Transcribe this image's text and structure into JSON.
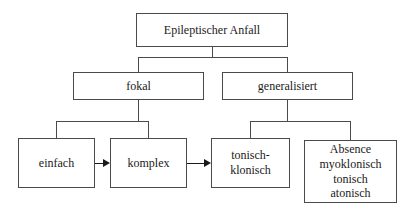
{
  "diagram": {
    "title_text": "Epileptischer Anfall",
    "nodes": [
      {
        "id": "root",
        "label": "Epileptischer Anfall",
        "x": 136,
        "y": 13,
        "w": 152,
        "h": 34
      },
      {
        "id": "fokal",
        "label": "fokal",
        "x": 73,
        "y": 72,
        "w": 131,
        "h": 28
      },
      {
        "id": "generalisiert",
        "label": "generalisiert",
        "x": 222,
        "y": 72,
        "w": 131,
        "h": 28
      },
      {
        "id": "einfach",
        "label": "einfach",
        "x": 18,
        "y": 138,
        "w": 77,
        "h": 50
      },
      {
        "id": "komplex",
        "label": "komplex",
        "x": 110,
        "y": 138,
        "w": 77,
        "h": 50
      },
      {
        "id": "tonisch-klonisch",
        "label": "tonisch-\nklonisch",
        "x": 211,
        "y": 138,
        "w": 79,
        "h": 50
      },
      {
        "id": "absence-group",
        "label": "Absence\nmyoklonisch\ntonisch\natonisch",
        "x": 304,
        "y": 140,
        "w": 93,
        "h": 63
      }
    ],
    "connectors": [
      {
        "id": "root-stem",
        "orient": "v",
        "x": 212,
        "y": 47,
        "len": 11
      },
      {
        "id": "root-crossbar",
        "orient": "h",
        "x": 138,
        "y": 57,
        "len": 150
      },
      {
        "id": "fokal-drop",
        "orient": "v",
        "x": 138,
        "y": 57,
        "len": 16
      },
      {
        "id": "generalisiert-drop",
        "orient": "v",
        "x": 287,
        "y": 57,
        "len": 16
      },
      {
        "id": "fokal-stem",
        "orient": "v",
        "x": 138,
        "y": 100,
        "len": 22
      },
      {
        "id": "fokal-crossbar",
        "orient": "h",
        "x": 56,
        "y": 121,
        "len": 93
      },
      {
        "id": "einfach-drop",
        "orient": "v",
        "x": 56,
        "y": 121,
        "len": 18
      },
      {
        "id": "komplex-drop",
        "orient": "v",
        "x": 148,
        "y": 121,
        "len": 18
      },
      {
        "id": "generalisiert-stem",
        "orient": "v",
        "x": 287,
        "y": 100,
        "len": 22
      },
      {
        "id": "general-crossbar",
        "orient": "h",
        "x": 250,
        "y": 121,
        "len": 101
      },
      {
        "id": "tonisch-drop",
        "orient": "v",
        "x": 250,
        "y": 121,
        "len": 18
      },
      {
        "id": "absence-drop",
        "orient": "v",
        "x": 350,
        "y": 121,
        "len": 20
      }
    ],
    "arrows": [
      {
        "id": "einfach-to-komplex",
        "x": 95,
        "y": 163,
        "len": 8
      },
      {
        "id": "komplex-to-tonisch",
        "x": 187,
        "y": 163,
        "len": 17
      }
    ]
  },
  "colors": {
    "box_border": "#4a4a4a",
    "connector": "#4a4a4a",
    "arrow": "#1a1a1a",
    "text": "#1a1a1a",
    "background": "#ffffff"
  }
}
